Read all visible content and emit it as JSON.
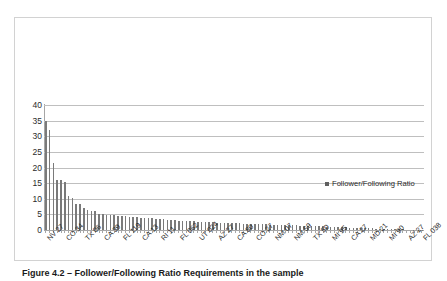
{
  "figure": {
    "caption": "Figure 4.2 – Follower/Following Ratio Requirements in the sample"
  },
  "legend": {
    "label": "Follower/Following Ratio",
    "marker_color": "#5f5f5f",
    "position": "right-middle"
  },
  "chart_data": {
    "type": "bar",
    "title": "",
    "subtitle": "",
    "xlabel": "",
    "ylabel": "",
    "ylim": [
      0,
      40
    ],
    "yticks": [
      0,
      5,
      10,
      15,
      20,
      25,
      30,
      35,
      40
    ],
    "ytick_labels": [
      "0",
      "5",
      "10",
      "15",
      "20",
      "25",
      "30",
      "35",
      "40"
    ],
    "grid": true,
    "grid_axis": "y",
    "bar_color": "#7a7a7a",
    "series": [
      {
        "name": "Follower/Following Ratio",
        "values": [
          35.0,
          32.0,
          21.4,
          16.1,
          15.9,
          15.3,
          10.9,
          10.2,
          8.4,
          8.3,
          7.2,
          6.3,
          6.1,
          6.0,
          5.2,
          5.0,
          4.8,
          4.8,
          4.7,
          4.6,
          4.5,
          4.4,
          4.3,
          4.2,
          4.1,
          4.0,
          3.9,
          3.8,
          3.7,
          3.6,
          3.5,
          3.4,
          3.3,
          3.2,
          3.1,
          3.0,
          2.9,
          2.85,
          2.8,
          2.75,
          2.7,
          2.6,
          2.55,
          2.5,
          2.45,
          2.4,
          2.35,
          2.3,
          2.25,
          2.2,
          2.15,
          2.1,
          2.05,
          2.0,
          1.95,
          1.9,
          1.85,
          1.8,
          1.78,
          1.75,
          1.7,
          1.68,
          1.65,
          1.6,
          1.55,
          1.5,
          1.45,
          1.4,
          1.38,
          1.35,
          1.3,
          1.25,
          1.2,
          1.15,
          1.1,
          1.05,
          1.0,
          0.95,
          0.9,
          0.85,
          0.8,
          0.75,
          0.7,
          0.65,
          0.6,
          0.55,
          0.5,
          0.45,
          0.4,
          0.36,
          0.32,
          0.28,
          0.25,
          0.22,
          0.19,
          0.16,
          0.13,
          0.1,
          0.07,
          0.038
        ]
      }
    ],
    "categories": [
      "NV 27",
      "",
      "",
      "",
      "",
      "CO 34",
      "",
      "",
      "",
      "",
      "TX 06",
      "",
      "",
      "",
      "",
      "CA 39",
      "",
      "",
      "",
      "",
      "FL 119",
      "",
      "",
      "",
      "",
      "CA 13",
      "",
      "",
      "",
      "",
      "RI 11",
      "",
      "",
      "",
      "",
      "FL 062",
      "",
      "",
      "",
      "",
      "UT 024",
      "",
      "",
      "",
      "",
      "AZ 27",
      "",
      "",
      "",
      "",
      "CA 80",
      "",
      "",
      "",
      "",
      "CO 27",
      "",
      "",
      "",
      "",
      "NM 07",
      "",
      "",
      "",
      "",
      "NM 59",
      "",
      "",
      "",
      "",
      "TX 50",
      "",
      "",
      "",
      "",
      "MI 95",
      "",
      "",
      "",
      "",
      "CA 27",
      "",
      "",
      "",
      "",
      "MD 21",
      "",
      "",
      "",
      "",
      "MI 90",
      "",
      "",
      "",
      "",
      "AZ 27",
      "",
      "",
      "",
      "FL 038"
    ],
    "xtick_labels": [
      "NV 27",
      "CO 34",
      "TX 06",
      "CA 39",
      "FL 119",
      "CA 13",
      "RI 11",
      "FL 062",
      "UT 024",
      "AZ 27",
      "CA 80",
      "CO 27",
      "NM 07",
      "NM 59",
      "TX 50",
      "MI 95",
      "CA 27",
      "MD 21",
      "MI 90",
      "AZ 27",
      "FL 038"
    ]
  }
}
